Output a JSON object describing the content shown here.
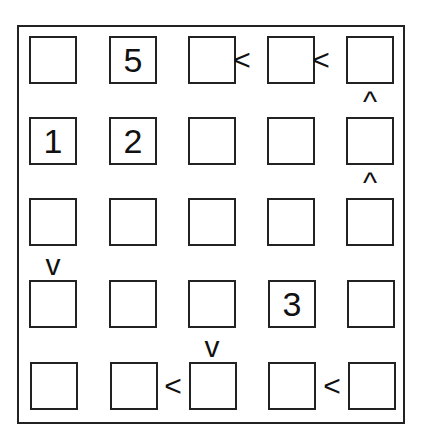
{
  "puzzle": {
    "type": "futoshiki",
    "size": 5,
    "grid": [
      [
        "",
        "5",
        "",
        "",
        ""
      ],
      [
        "1",
        "2",
        "",
        "",
        ""
      ],
      [
        "",
        "",
        "",
        "",
        ""
      ],
      [
        "",
        "",
        "",
        "3",
        ""
      ],
      [
        "",
        "",
        "",
        "",
        ""
      ]
    ],
    "horizontal_constraints": [
      {
        "row": 0,
        "between_cols": [
          2,
          3
        ],
        "symbol": "<"
      },
      {
        "row": 0,
        "between_cols": [
          3,
          4
        ],
        "symbol": "<"
      },
      {
        "row": 4,
        "between_cols": [
          1,
          2
        ],
        "symbol": "<"
      },
      {
        "row": 4,
        "between_cols": [
          3,
          4
        ],
        "symbol": "<"
      }
    ],
    "vertical_constraints": [
      {
        "col": 4,
        "between_rows": [
          0,
          1
        ],
        "symbol": "^"
      },
      {
        "col": 4,
        "between_rows": [
          1,
          2
        ],
        "symbol": "^"
      },
      {
        "col": 0,
        "between_rows": [
          2,
          3
        ],
        "symbol": "v"
      },
      {
        "col": 2,
        "between_rows": [
          3,
          4
        ],
        "symbol": "v"
      }
    ]
  }
}
